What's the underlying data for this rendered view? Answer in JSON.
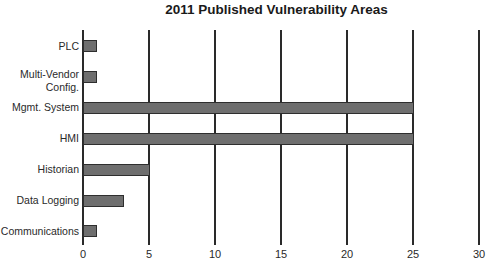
{
  "chart_data": {
    "type": "bar",
    "orientation": "horizontal",
    "title": "2011 Published Vulnerability Areas",
    "xlabel": "",
    "ylabel": "",
    "categories": [
      "PLC",
      "Multi-Vendor Config.",
      "Mgmt. System",
      "HMI",
      "Historian",
      "Data Logging",
      "Communications"
    ],
    "category_lines": [
      [
        "PLC"
      ],
      [
        "Multi-Vendor",
        "Config."
      ],
      [
        "Mgmt. System"
      ],
      [
        "HMI"
      ],
      [
        "Historian"
      ],
      [
        "Data Logging"
      ],
      [
        "Communications"
      ]
    ],
    "values": [
      1,
      1,
      25,
      25,
      5,
      3,
      1
    ],
    "xlim": [
      0,
      30
    ],
    "xticks": [
      "0",
      "5",
      "10",
      "15",
      "20",
      "25",
      "30"
    ],
    "grid": "vertical lines at each tick",
    "legend": "none",
    "bar_color": "#6e6e6e"
  }
}
